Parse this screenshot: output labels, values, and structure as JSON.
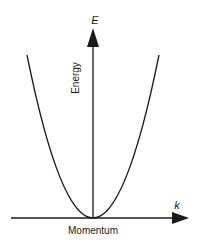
{
  "diagram": {
    "type": "dispersion-relation",
    "curve": "parabola",
    "y_axis": {
      "symbol": "E",
      "label": "Energy"
    },
    "x_axis": {
      "symbol": "k",
      "label": "Momentum"
    },
    "colors": {
      "line": "#1a1a1a",
      "background": "#ffffff"
    }
  }
}
